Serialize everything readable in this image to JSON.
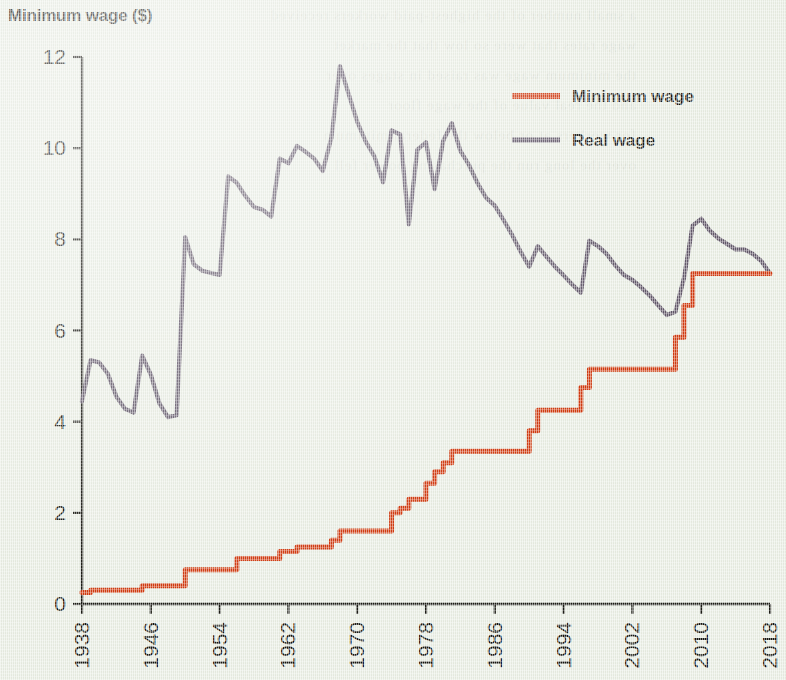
{
  "figure": {
    "axis_title": "Minimum wage ($)",
    "background_color": "#e9eee3",
    "axis_color": "#1b1b14"
  },
  "legend": {
    "position": "top-right",
    "entries": [
      {
        "label": "Minimum wage",
        "color": "#d23c11"
      },
      {
        "label": "Real wage",
        "color": "#63596a"
      }
    ]
  },
  "chart_data": {
    "type": "line",
    "title": "Minimum wage ($)",
    "subtitle": "",
    "xlabel": "",
    "ylabel": "Minimum wage ($)",
    "xlim": [
      1938,
      2018
    ],
    "ylim": [
      0,
      12
    ],
    "grid": false,
    "legend_position": "top-right",
    "xticks": [
      1938,
      1946,
      1954,
      1962,
      1970,
      1978,
      1986,
      1994,
      2002,
      2010,
      2018
    ],
    "yticks": [
      0,
      2,
      4,
      6,
      8,
      10,
      12
    ],
    "xtick_labels": [
      "1938",
      "1946",
      "1954",
      "1962",
      "1970",
      "1978",
      "1986",
      "1994",
      "2002",
      "2010",
      "2018"
    ],
    "ytick_labels": [
      "0",
      "2",
      "4",
      "6",
      "8",
      "10",
      "12"
    ],
    "series": [
      {
        "name": "Minimum wage",
        "color": "#d23c11",
        "style": "step",
        "x": [
          1938,
          1939,
          1945,
          1950,
          1956,
          1961,
          1963,
          1967,
          1968,
          1974,
          1975,
          1976,
          1978,
          1979,
          1980,
          1981,
          1990,
          1991,
          1996,
          1997,
          2007,
          2008,
          2009,
          2018
        ],
        "values": [
          0.25,
          0.3,
          0.4,
          0.75,
          1.0,
          1.15,
          1.25,
          1.4,
          1.6,
          2.0,
          2.1,
          2.3,
          2.65,
          2.9,
          3.1,
          3.35,
          3.8,
          4.25,
          4.75,
          5.15,
          5.85,
          6.55,
          7.25,
          7.25
        ]
      },
      {
        "name": "Real wage",
        "color": "#63596a",
        "style": "line",
        "x": [
          1938,
          1939,
          1940,
          1941,
          1942,
          1943,
          1944,
          1945,
          1946,
          1947,
          1948,
          1949,
          1950,
          1951,
          1952,
          1953,
          1954,
          1955,
          1956,
          1957,
          1958,
          1959,
          1960,
          1961,
          1962,
          1963,
          1964,
          1965,
          1966,
          1967,
          1968,
          1969,
          1970,
          1971,
          1972,
          1973,
          1974,
          1975,
          1976,
          1977,
          1978,
          1979,
          1980,
          1981,
          1982,
          1983,
          1984,
          1985,
          1986,
          1987,
          1988,
          1989,
          1990,
          1991,
          1992,
          1993,
          1994,
          1995,
          1996,
          1997,
          1998,
          1999,
          2000,
          2001,
          2002,
          2003,
          2004,
          2005,
          2006,
          2007,
          2008,
          2009,
          2010,
          2011,
          2012,
          2013,
          2014,
          2015,
          2016,
          2017,
          2018
        ],
        "values": [
          4.45,
          5.35,
          5.3,
          5.05,
          4.55,
          4.28,
          4.2,
          5.45,
          5.03,
          4.4,
          4.1,
          4.14,
          8.05,
          7.45,
          7.31,
          7.26,
          7.22,
          9.38,
          9.24,
          8.95,
          8.71,
          8.65,
          8.5,
          9.77,
          9.67,
          10.05,
          9.92,
          9.77,
          9.5,
          10.23,
          11.8,
          11.19,
          10.58,
          10.14,
          9.82,
          9.25,
          10.39,
          10.3,
          8.33,
          9.97,
          10.13,
          9.1,
          10.16,
          10.55,
          9.94,
          9.63,
          9.23,
          8.91,
          8.74,
          8.43,
          8.1,
          7.73,
          7.4,
          7.85,
          7.62,
          7.4,
          7.21,
          7.01,
          6.83,
          7.97,
          7.85,
          7.68,
          7.43,
          7.22,
          7.11,
          6.95,
          6.77,
          6.55,
          6.34,
          6.41,
          7.15,
          8.3,
          8.45,
          8.19,
          8.02,
          7.9,
          7.78,
          7.78,
          7.68,
          7.52,
          7.25
        ]
      }
    ]
  },
  "show_through": [
    "a small number of the highest-paid workers received",
    "wage rates that were so low that the market",
    "the minimum wage was raised in stages over",
    "and the real value of the wage floor",
    "for workers at or below the federal minimum",
    "over the long run the purchasing power fell"
  ]
}
